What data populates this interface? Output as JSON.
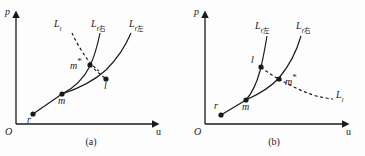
{
  "figure": {
    "background_color": "#fdfdfd",
    "ink_color": "#1a1a1a"
  },
  "panels": [
    {
      "id": "a",
      "caption": "(a)",
      "axes": {
        "y_label": "p",
        "x_label": "u",
        "origin_label": "O"
      },
      "curve_labels": [
        {
          "name": "L-l",
          "base": "L",
          "sub": "l",
          "sub_type": "latin",
          "style": "dashed"
        },
        {
          "name": "L-r-right",
          "base": "L",
          "sub": "r右",
          "sub_type": "mixed",
          "style": "solid"
        },
        {
          "name": "L-r-left",
          "base": "L",
          "sub": "r左",
          "sub_type": "mixed",
          "style": "solid"
        }
      ],
      "points": [
        {
          "name": "r",
          "label": "r",
          "starred": false
        },
        {
          "name": "m",
          "label": "m",
          "starred": false
        },
        {
          "name": "m-star",
          "label": "m",
          "starred": true
        },
        {
          "name": "l",
          "label": "l",
          "starred": false
        }
      ]
    },
    {
      "id": "b",
      "caption": "(b)",
      "axes": {
        "y_label": "p",
        "x_label": "u",
        "origin_label": "O"
      },
      "curve_labels": [
        {
          "name": "L-r-left",
          "base": "L",
          "sub": "r左",
          "sub_type": "mixed",
          "style": "solid"
        },
        {
          "name": "L-r-right",
          "base": "L",
          "sub": "r右",
          "sub_type": "mixed",
          "style": "solid"
        },
        {
          "name": "L-l",
          "base": "L",
          "sub": "l",
          "sub_type": "latin",
          "style": "dashed"
        }
      ],
      "points": [
        {
          "name": "r",
          "label": "r",
          "starred": false
        },
        {
          "name": "m",
          "label": "m",
          "starred": false
        },
        {
          "name": "l",
          "label": "l",
          "starred": false
        },
        {
          "name": "m-star",
          "label": "m",
          "starred": true
        }
      ]
    }
  ]
}
